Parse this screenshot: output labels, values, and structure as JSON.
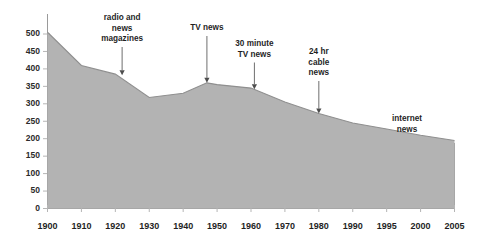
{
  "chart_data": {
    "type": "area",
    "title": "",
    "subtitle": "",
    "xlabel": "",
    "ylabel": "",
    "xlim": [
      1900,
      2005
    ],
    "ylim": [
      0,
      500
    ],
    "grid": false,
    "legend_position": "none",
    "x_tick_labels": [
      "1900",
      "1910",
      "1920",
      "1930",
      "1940",
      "1950",
      "1960",
      "1970",
      "1980",
      "1990",
      "1995",
      "2000",
      "2005"
    ],
    "y_tick_labels": [
      "0",
      "50",
      "100",
      "150",
      "200",
      "250",
      "300",
      "350",
      "400",
      "450",
      "500"
    ],
    "y_ticks": [
      0,
      50,
      100,
      150,
      200,
      250,
      300,
      350,
      400,
      450,
      500
    ],
    "series": [
      {
        "name": "circulation",
        "x": [
          1900,
          1910,
          1920,
          1930,
          1940,
          1947,
          1950,
          1960,
          1970,
          1980,
          1990,
          1995,
          2000,
          2005
        ],
        "values": [
          505,
          410,
          385,
          318,
          330,
          360,
          355,
          345,
          305,
          272,
          245,
          228,
          210,
          195
        ]
      }
    ],
    "annotations": [
      {
        "text": "radio and\nnews\nmagazines",
        "lines": [
          "radio and",
          "news",
          "magazines"
        ],
        "x": 1922,
        "y": 382
      },
      {
        "text": "TV news",
        "lines": [
          "TV news"
        ],
        "x": 1947,
        "y": 360
      },
      {
        "text": "30 minute\nTV news",
        "lines": [
          "30 minute",
          "TV news"
        ],
        "x": 1961,
        "y": 342
      },
      {
        "text": "24 hr\ncable\nnews",
        "lines": [
          "24 hr",
          "cable",
          "news"
        ],
        "x": 1980,
        "y": 272
      },
      {
        "text": "internet\nnews",
        "lines": [
          "internet",
          "news"
        ],
        "x": 1998,
        "y": 215
      }
    ],
    "colors": {
      "area_fill": "#b3b3b3",
      "area_stroke": "#8f8f8f",
      "axis": "#9a9a9a",
      "text": "#1f1f1f",
      "arrow": "#6e6e6e",
      "background": "#ffffff"
    }
  }
}
